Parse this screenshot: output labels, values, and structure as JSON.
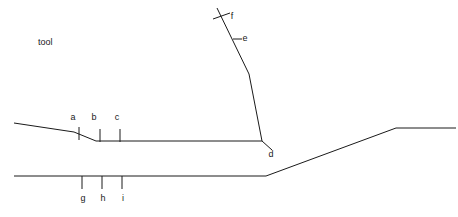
{
  "canvas": {
    "width": 458,
    "height": 217,
    "background": "#ffffff",
    "stroke_color": "#1a1a1a"
  },
  "caption": {
    "text": "tool",
    "x": 38,
    "y": 38
  },
  "labels": [
    {
      "key": "a",
      "text": "a",
      "x": 73,
      "y": 117
    },
    {
      "key": "b",
      "text": "b",
      "x": 94,
      "y": 117
    },
    {
      "key": "c",
      "text": "c",
      "x": 117,
      "y": 117
    },
    {
      "key": "d",
      "text": "d",
      "x": 271,
      "y": 154
    },
    {
      "key": "e",
      "text": "e",
      "x": 245,
      "y": 38
    },
    {
      "key": "f",
      "text": "f",
      "x": 232,
      "y": 16
    },
    {
      "key": "g",
      "text": "g",
      "x": 83,
      "y": 198
    },
    {
      "key": "h",
      "text": "h",
      "x": 103,
      "y": 198
    },
    {
      "key": "i",
      "text": "i",
      "x": 123,
      "y": 198
    }
  ],
  "polylines": [
    {
      "name": "upper-profile",
      "points": "14,123 74,132 96,141 262,141"
    },
    {
      "name": "steep-descending-line",
      "points": "217,8 249,74 262,141 272,150"
    },
    {
      "name": "lower-profile",
      "points": "14,176 266,176 396,128 456,128"
    }
  ],
  "ticks": [
    {
      "key": "a",
      "x1": 79,
      "y1": 127,
      "x2": 79,
      "y2": 140
    },
    {
      "key": "b",
      "x1": 100,
      "y1": 129,
      "x2": 100,
      "y2": 142
    },
    {
      "key": "c",
      "x1": 120,
      "y1": 129,
      "x2": 120,
      "y2": 142
    },
    {
      "key": "e",
      "x1": 233,
      "y1": 39,
      "x2": 242,
      "y2": 39
    },
    {
      "key": "f",
      "x1": 213,
      "y1": 19,
      "x2": 230,
      "y2": 13
    },
    {
      "key": "g",
      "x1": 82,
      "y1": 176,
      "x2": 82,
      "y2": 189
    },
    {
      "key": "h",
      "x1": 102,
      "y1": 176,
      "x2": 102,
      "y2": 189
    },
    {
      "key": "i",
      "x1": 122,
      "y1": 176,
      "x2": 122,
      "y2": 189
    }
  ]
}
